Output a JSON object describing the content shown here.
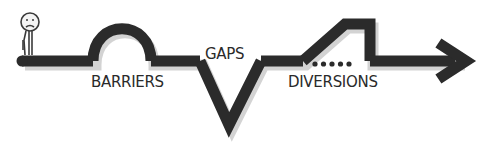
{
  "labels": {
    "barriers": "BARRIERS",
    "gaps": "GAPS",
    "diversions": "DIVERSIONS"
  },
  "colors": {
    "path": "#2b2b2b",
    "shadow": "#c8c8c8",
    "background": "#ffffff"
  },
  "figure": {
    "expression": "sad"
  },
  "icons": {
    "end": "arrow-right-icon",
    "start": "person-icon",
    "dots": "dotted-trail-icon"
  },
  "dot_count": 5
}
